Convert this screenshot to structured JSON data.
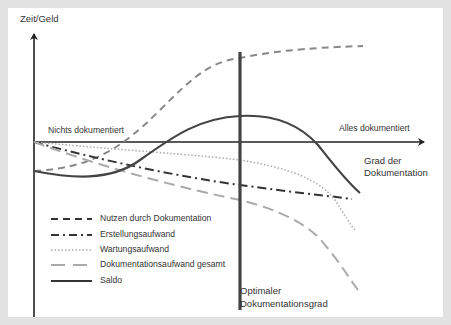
{
  "diagram": {
    "y_axis_label": "Zeit/Geld",
    "x_axis_label_line1": "Grad der",
    "x_axis_label_line2": "Dokumentation",
    "left_annotation": "Nichts dokumentiert",
    "right_annotation": "Alles dokumentiert",
    "optimum_label_line1": "Optimaler",
    "optimum_label_line2": "Dokumentationsgrad",
    "legend": [
      {
        "label": "Nutzen durch Dokumentation",
        "style": "dashed",
        "color": "#888888"
      },
      {
        "label": "Erstellungsaufwand",
        "style": "dash-dot",
        "color": "#333333"
      },
      {
        "label": "Wartungsaufwand",
        "style": "dotted",
        "color": "#aaaaaa"
      },
      {
        "label": "Dokumentationsaufwand gesamt",
        "style": "long-dashed",
        "color": "#aaaaaa"
      },
      {
        "label": "Saldo",
        "style": "solid",
        "color": "#444444"
      }
    ]
  },
  "colors": {
    "background": "#e2e2e2",
    "panel": "#ffffff",
    "axis": "#222222",
    "optimum_line": "#444444"
  }
}
